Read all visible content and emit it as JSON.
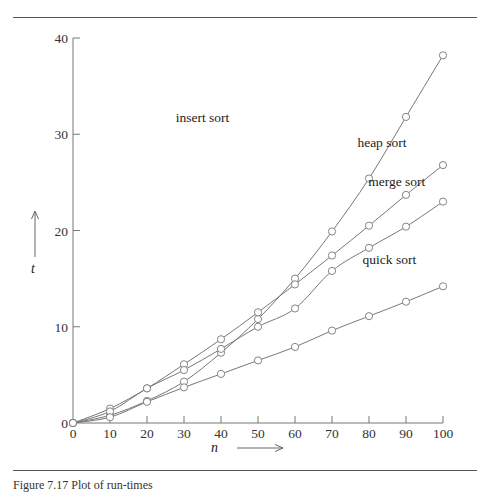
{
  "figure": {
    "caption": "Figure 7.17 Plot of run-times"
  },
  "chart_data": {
    "type": "line",
    "title": "",
    "xlabel": "n",
    "ylabel": "t",
    "xlim": [
      0,
      100
    ],
    "ylim": [
      0,
      40
    ],
    "grid": false,
    "legend_position": "inline labels at line ends",
    "x": [
      0,
      10,
      20,
      30,
      40,
      50,
      60,
      70,
      80,
      90,
      100
    ],
    "x_ticks": [
      "0",
      "10",
      "20",
      "30",
      "40",
      "50",
      "60",
      "70",
      "80",
      "90",
      "100"
    ],
    "y_ticks": [
      "0",
      "10",
      "20",
      "30",
      "40"
    ],
    "series": [
      {
        "name": "insert sort",
        "values": [
          0,
          0.8,
          2.3,
          4.3,
          7.3,
          10.8,
          15.0,
          19.9,
          25.4,
          31.8,
          38.2
        ],
        "label_pos": [
          35,
          31.3
        ]
      },
      {
        "name": "heap sort",
        "values": [
          0,
          1.5,
          3.6,
          6.1,
          8.7,
          11.5,
          14.4,
          17.4,
          20.5,
          23.7,
          26.8
        ],
        "label_pos": [
          83.5,
          28.7
        ]
      },
      {
        "name": "merge sort",
        "values": [
          0,
          1.2,
          3.6,
          5.5,
          7.7,
          10.0,
          11.9,
          15.8,
          18.2,
          20.4,
          23.0
        ],
        "label_pos": [
          87.5,
          24.6
        ]
      },
      {
        "name": "quick sort",
        "values": [
          0,
          0.6,
          2.2,
          3.7,
          5.1,
          6.5,
          7.9,
          9.6,
          11.1,
          12.6,
          14.2
        ],
        "label_pos": [
          85.5,
          16.5
        ]
      }
    ]
  }
}
